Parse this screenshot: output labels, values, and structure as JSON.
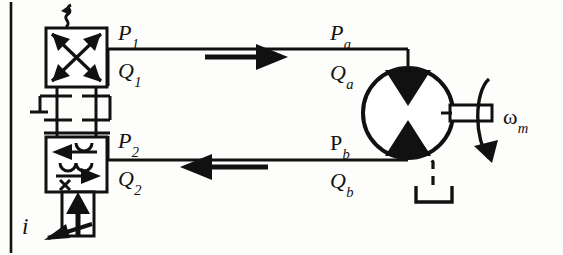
{
  "diagram": {
    "type": "hydraulic-schematic",
    "canvas": {
      "width": 563,
      "height": 255
    },
    "stroke_color": "#111111",
    "background_color": "#fdfdfb"
  },
  "labels": {
    "p1": {
      "base": "P",
      "sub": "1"
    },
    "q1": {
      "base": "Q",
      "sub": "1"
    },
    "p2": {
      "base": "P",
      "sub": "2"
    },
    "q2": {
      "base": "Q",
      "sub": "2"
    },
    "pa": {
      "base": "P",
      "sub": "a"
    },
    "qa": {
      "base": "Q",
      "sub": "a"
    },
    "pb": {
      "base": "P",
      "sub": "b"
    },
    "qb": {
      "base": "Q",
      "sub": "b"
    },
    "i": {
      "base": "i",
      "sub": ""
    },
    "wm": {
      "base": "ω",
      "sub": "m"
    }
  },
  "components": {
    "valve": {
      "name": "four-way-servo-valve",
      "upper_box_label": "crossed-flow-position",
      "lower_box_label": "parallel-flow-position",
      "spring_label": "spring-return",
      "actuator_label": "solenoid-current-input"
    },
    "motor": {
      "name": "bidirectional-hydraulic-motor",
      "shaft_label": "output-shaft",
      "rotation_label": "shaft-rotation-arrow",
      "drain_label": "case-drain-to-reservoir"
    },
    "lines": {
      "top_line_label": "supply-line-p1-to-pa",
      "bottom_line_label": "return-line-pb-to-p2",
      "top_flow_direction": "right",
      "bottom_flow_direction": "left"
    },
    "border": {
      "name": "page-rule-left",
      "visible": true
    }
  }
}
